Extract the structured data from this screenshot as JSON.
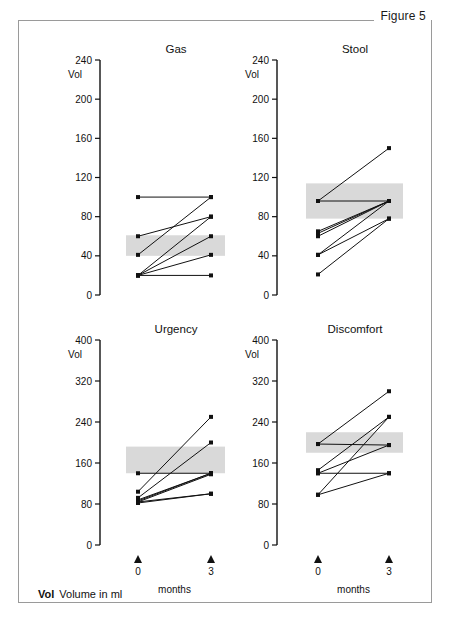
{
  "figure": {
    "label": "Figure 5"
  },
  "footnote": {
    "abbrev": "Vol",
    "text": "Volume in ml"
  },
  "axis": {
    "y_title": "Vol",
    "x_title": "months",
    "x_ticks": [
      "0",
      "3"
    ],
    "x_marker": "triangle-up-marker"
  },
  "chart_data": [
    {
      "type": "line",
      "title": "Gas",
      "xlabel": "months",
      "ylabel": "Vol",
      "x": [
        0,
        3
      ],
      "xticklabels": [
        "0",
        "3"
      ],
      "ylim": [
        0,
        240
      ],
      "yticks": [
        0,
        40,
        80,
        120,
        160,
        200,
        240
      ],
      "yticklabels": [
        "0",
        "40",
        "80",
        "120",
        "160",
        "200",
        "240"
      ],
      "grid": false,
      "legend": "none",
      "band": {
        "label": "interquartile-band",
        "y0": 40,
        "y1": 61,
        "color": "#d9d9d9"
      },
      "series": [
        {
          "name": "subject-1",
          "values": [
            100,
            100
          ]
        },
        {
          "name": "subject-2",
          "values": [
            60,
            80
          ]
        },
        {
          "name": "subject-3",
          "values": [
            41,
            100
          ]
        },
        {
          "name": "subject-4",
          "values": [
            20,
            80
          ]
        },
        {
          "name": "subject-5",
          "values": [
            20,
            60
          ]
        },
        {
          "name": "subject-6",
          "values": [
            20,
            41
          ]
        },
        {
          "name": "subject-7",
          "values": [
            20,
            20
          ]
        }
      ]
    },
    {
      "type": "line",
      "title": "Stool",
      "xlabel": "months",
      "ylabel": "Vol",
      "x": [
        0,
        3
      ],
      "xticklabels": [
        "0",
        "3"
      ],
      "ylim": [
        0,
        240
      ],
      "yticks": [
        0,
        40,
        80,
        120,
        160,
        200,
        240
      ],
      "yticklabels": [
        "0",
        "40",
        "80",
        "120",
        "160",
        "200",
        "240"
      ],
      "grid": false,
      "legend": "none",
      "band": {
        "label": "interquartile-band",
        "y0": 78,
        "y1": 114,
        "color": "#d9d9d9"
      },
      "series": [
        {
          "name": "subject-1",
          "values": [
            96,
            150
          ]
        },
        {
          "name": "subject-2",
          "values": [
            96,
            96
          ]
        },
        {
          "name": "subject-3",
          "values": [
            65,
            96
          ]
        },
        {
          "name": "subject-4",
          "values": [
            63,
            96
          ]
        },
        {
          "name": "subject-5",
          "values": [
            60,
            96
          ]
        },
        {
          "name": "subject-6",
          "values": [
            41,
            96
          ]
        },
        {
          "name": "subject-7",
          "values": [
            41,
            78
          ]
        },
        {
          "name": "subject-8",
          "values": [
            21,
            78
          ]
        }
      ]
    },
    {
      "type": "line",
      "title": "Urgency",
      "xlabel": "months",
      "ylabel": "Vol",
      "x": [
        0,
        3
      ],
      "xticklabels": [
        "0",
        "3"
      ],
      "ylim": [
        0,
        400
      ],
      "yticks": [
        0,
        80,
        160,
        240,
        320,
        400
      ],
      "yticklabels": [
        "0",
        "80",
        "160",
        "240",
        "320",
        "400"
      ],
      "grid": false,
      "legend": "none",
      "band": {
        "label": "interquartile-band",
        "y0": 140,
        "y1": 192,
        "color": "#d9d9d9"
      },
      "series": [
        {
          "name": "subject-1",
          "values": [
            140,
            140
          ]
        },
        {
          "name": "subject-2",
          "values": [
            104,
            250
          ]
        },
        {
          "name": "subject-3",
          "values": [
            92,
            200
          ]
        },
        {
          "name": "subject-4",
          "values": [
            88,
            140
          ]
        },
        {
          "name": "subject-5",
          "values": [
            86,
            140
          ]
        },
        {
          "name": "subject-6",
          "values": [
            84,
            138
          ]
        },
        {
          "name": "subject-7",
          "values": [
            84,
            100
          ]
        },
        {
          "name": "subject-8",
          "values": [
            82,
            100
          ]
        }
      ]
    },
    {
      "type": "line",
      "title": "Discomfort",
      "xlabel": "months",
      "ylabel": "Vol",
      "x": [
        0,
        3
      ],
      "xticklabels": [
        "0",
        "3"
      ],
      "ylim": [
        0,
        400
      ],
      "yticks": [
        0,
        80,
        160,
        240,
        320,
        400
      ],
      "yticklabels": [
        "0",
        "80",
        "160",
        "240",
        "320",
        "400"
      ],
      "grid": false,
      "legend": "none",
      "band": {
        "label": "interquartile-band",
        "y0": 180,
        "y1": 220,
        "color": "#d9d9d9"
      },
      "series": [
        {
          "name": "subject-1",
          "values": [
            197,
            300
          ]
        },
        {
          "name": "subject-2",
          "values": [
            197,
            195
          ]
        },
        {
          "name": "subject-3",
          "values": [
            146,
            250
          ]
        },
        {
          "name": "subject-4",
          "values": [
            140,
            195
          ]
        },
        {
          "name": "subject-5",
          "values": [
            140,
            140
          ]
        },
        {
          "name": "subject-6",
          "values": [
            98,
            250
          ]
        },
        {
          "name": "subject-7",
          "values": [
            98,
            140
          ]
        }
      ]
    }
  ]
}
